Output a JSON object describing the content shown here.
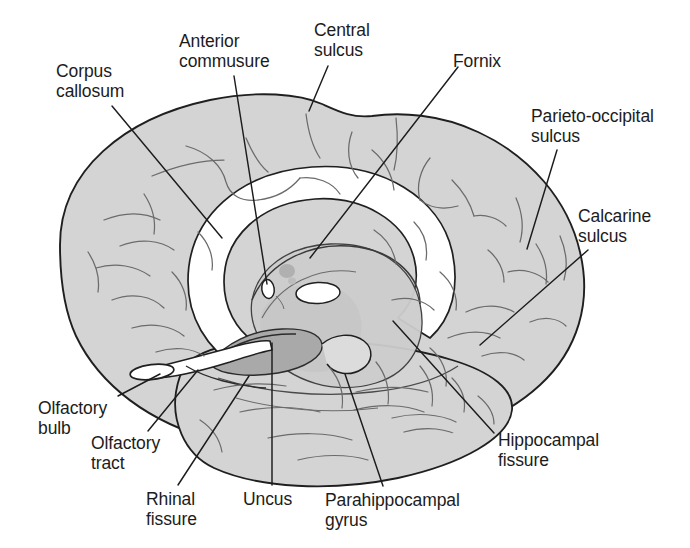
{
  "figure": {
    "background_color": "#ffffff",
    "width": 690,
    "height": 548
  },
  "colors": {
    "cortex_fill": "#d4d4d4",
    "cortex_fill_light": "#dedede",
    "deep_structure_fill": "#c8c8c8",
    "uncus_fill": "#a9a9a9",
    "thalamus_spot_fill": "#b0b0b0",
    "white_matter_fill": "#ffffff",
    "outline_stroke": "#1f1f1f",
    "sulci_stroke": "#6b6b6b",
    "leader_line_stroke": "#1c1c1c",
    "text_color": "#1c1c1c"
  },
  "labels": [
    {
      "id": "corpus-callosum",
      "lines": [
        "Corpus",
        "callosum"
      ],
      "x": 56,
      "y": 61,
      "align": "left",
      "leader": {
        "x1": 112,
        "y1": 106,
        "x2": 222,
        "y2": 238
      }
    },
    {
      "id": "anterior-commusure",
      "lines": [
        "Anterior",
        "commusure"
      ],
      "x": 179,
      "y": 31,
      "align": "left",
      "leader": {
        "x1": 234,
        "y1": 76,
        "x2": 267,
        "y2": 284
      }
    },
    {
      "id": "central-sulcus",
      "lines": [
        "Central",
        "sulcus"
      ],
      "x": 314,
      "y": 20,
      "align": "left",
      "leader": {
        "x1": 328,
        "y1": 66,
        "x2": 309,
        "y2": 111
      }
    },
    {
      "id": "fornix",
      "lines": [
        "Fornix"
      ],
      "x": 453,
      "y": 51,
      "align": "left",
      "leader": {
        "x1": 458,
        "y1": 67,
        "x2": 310,
        "y2": 258
      }
    },
    {
      "id": "parieto-occipital-sulcus",
      "lines": [
        "Parieto-occipital",
        "sulcus"
      ],
      "x": 531,
      "y": 106,
      "align": "left",
      "leader": {
        "x1": 557,
        "y1": 150,
        "x2": 527,
        "y2": 249
      }
    },
    {
      "id": "calcarine-sulcus",
      "lines": [
        "Calcarine",
        "sulcus"
      ],
      "x": 578,
      "y": 206,
      "align": "left",
      "leader": {
        "x1": 588,
        "y1": 250,
        "x2": 480,
        "y2": 345
      }
    },
    {
      "id": "hippocampal-fissure",
      "lines": [
        "Hippocampal",
        "fissure"
      ],
      "x": 498,
      "y": 430,
      "align": "left",
      "leader": {
        "x1": 494,
        "y1": 433,
        "x2": 393,
        "y2": 321
      }
    },
    {
      "id": "parahippocampal-gyrus",
      "lines": [
        "Parahippocampal",
        "gyrus"
      ],
      "x": 325,
      "y": 490,
      "align": "left",
      "leader": {
        "x1": 383,
        "y1": 486,
        "x2": 345,
        "y2": 374
      }
    },
    {
      "id": "uncus",
      "lines": [
        "Uncus"
      ],
      "x": 243,
      "y": 489,
      "align": "left",
      "leader": {
        "x1": 272,
        "y1": 485,
        "x2": 272,
        "y2": 343
      }
    },
    {
      "id": "rhinal-fissure",
      "lines": [
        "Rhinal",
        "fissure"
      ],
      "x": 146,
      "y": 489,
      "align": "left",
      "leader": {
        "x1": 178,
        "y1": 485,
        "x2": 249,
        "y2": 376
      }
    },
    {
      "id": "olfactory-tract",
      "lines": [
        "Olfactory",
        "tract"
      ],
      "x": 91,
      "y": 433,
      "align": "left",
      "leader": {
        "x1": 148,
        "y1": 431,
        "x2": 198,
        "y2": 370
      }
    },
    {
      "id": "olfactory-bulb",
      "lines": [
        "Olfactory",
        "bulb"
      ],
      "x": 38,
      "y": 398,
      "align": "left",
      "leader": {
        "x1": 118,
        "y1": 396,
        "x2": 160,
        "y2": 374
      }
    }
  ]
}
